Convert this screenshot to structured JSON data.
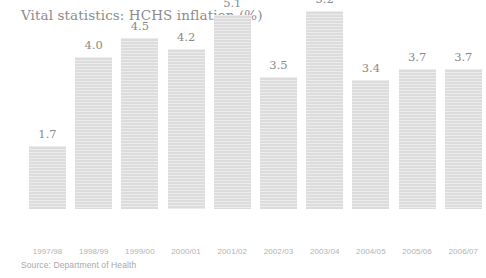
{
  "chart_data": {
    "type": "bar",
    "title": "Vital statistics: HCHS inflation (%)",
    "xlabel": "",
    "ylabel": "",
    "ylim": [
      0,
      5.6
    ],
    "grid": false,
    "legend": null,
    "source_note": "Source: Department of Health",
    "bar_color": "#dcdcdc",
    "text_color": "#8c8c8c",
    "tick_color": "#b2b2b2",
    "background_color": "#ffffff",
    "categories": [
      "1997/98",
      "1998/99",
      "1999/00",
      "2000/01",
      "2001/02",
      "2002/03",
      "2003/04",
      "2004/05",
      "2005/06",
      "2006/07"
    ],
    "values": [
      1.7,
      4.0,
      4.5,
      4.2,
      5.1,
      3.5,
      5.2,
      3.4,
      3.7,
      3.7
    ],
    "value_labels": [
      "1.7",
      "4.0",
      "4.5",
      "4.2",
      "5.1",
      "3.5",
      "5.2",
      "3.4",
      "3.7",
      "3.7"
    ]
  }
}
